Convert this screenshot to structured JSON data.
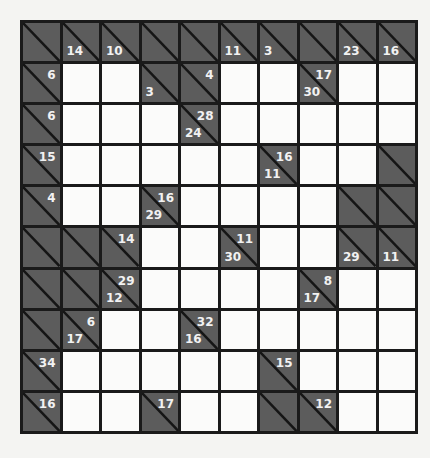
{
  "puzzle": {
    "type": "kakuro",
    "rows": 10,
    "cols": 10,
    "colors": {
      "block": "#5c5c5c",
      "white": "#fbfbfa",
      "grid_line": "#1a1a1a",
      "clue_text": "#f2f2f2"
    },
    "grid": [
      [
        {
          "t": "b"
        },
        {
          "t": "b",
          "down": "14"
        },
        {
          "t": "b",
          "down": "10"
        },
        {
          "t": "b"
        },
        {
          "t": "b"
        },
        {
          "t": "b",
          "down": "11"
        },
        {
          "t": "b",
          "down": "3"
        },
        {
          "t": "b"
        },
        {
          "t": "b",
          "down": "23"
        },
        {
          "t": "b",
          "down": "16"
        }
      ],
      [
        {
          "t": "b",
          "right": "6"
        },
        {
          "t": "w"
        },
        {
          "t": "w"
        },
        {
          "t": "b",
          "down": "3"
        },
        {
          "t": "b",
          "right": "4"
        },
        {
          "t": "w"
        },
        {
          "t": "w"
        },
        {
          "t": "b",
          "down": "30",
          "right": "17"
        },
        {
          "t": "w"
        },
        {
          "t": "w"
        }
      ],
      [
        {
          "t": "b",
          "right": "6"
        },
        {
          "t": "w"
        },
        {
          "t": "w"
        },
        {
          "t": "w"
        },
        {
          "t": "b",
          "down": "24",
          "right": "28"
        },
        {
          "t": "w"
        },
        {
          "t": "w"
        },
        {
          "t": "w"
        },
        {
          "t": "w"
        },
        {
          "t": "w"
        }
      ],
      [
        {
          "t": "b",
          "right": "15"
        },
        {
          "t": "w"
        },
        {
          "t": "w"
        },
        {
          "t": "w"
        },
        {
          "t": "w"
        },
        {
          "t": "w"
        },
        {
          "t": "b",
          "down": "11",
          "right": "16"
        },
        {
          "t": "w"
        },
        {
          "t": "w"
        },
        {
          "t": "b"
        }
      ],
      [
        {
          "t": "b",
          "right": "4"
        },
        {
          "t": "w"
        },
        {
          "t": "w"
        },
        {
          "t": "b",
          "down": "29",
          "right": "16"
        },
        {
          "t": "w"
        },
        {
          "t": "w"
        },
        {
          "t": "w"
        },
        {
          "t": "w"
        },
        {
          "t": "b"
        },
        {
          "t": "b"
        }
      ],
      [
        {
          "t": "b"
        },
        {
          "t": "b"
        },
        {
          "t": "b",
          "right": "14"
        },
        {
          "t": "w"
        },
        {
          "t": "w"
        },
        {
          "t": "b",
          "down": "30",
          "right": "11"
        },
        {
          "t": "w"
        },
        {
          "t": "w"
        },
        {
          "t": "b",
          "down": "29"
        },
        {
          "t": "b",
          "down": "11"
        }
      ],
      [
        {
          "t": "b"
        },
        {
          "t": "b"
        },
        {
          "t": "b",
          "down": "12",
          "right": "29"
        },
        {
          "t": "w"
        },
        {
          "t": "w"
        },
        {
          "t": "w"
        },
        {
          "t": "w"
        },
        {
          "t": "b",
          "down": "17",
          "right": "8"
        },
        {
          "t": "w"
        },
        {
          "t": "w"
        }
      ],
      [
        {
          "t": "b"
        },
        {
          "t": "b",
          "down": "17",
          "right": "6"
        },
        {
          "t": "w"
        },
        {
          "t": "w"
        },
        {
          "t": "b",
          "down": "16",
          "right": "32"
        },
        {
          "t": "w"
        },
        {
          "t": "w"
        },
        {
          "t": "w"
        },
        {
          "t": "w"
        },
        {
          "t": "w"
        }
      ],
      [
        {
          "t": "b",
          "right": "34"
        },
        {
          "t": "w"
        },
        {
          "t": "w"
        },
        {
          "t": "w"
        },
        {
          "t": "w"
        },
        {
          "t": "w"
        },
        {
          "t": "b",
          "right": "15"
        },
        {
          "t": "w"
        },
        {
          "t": "w"
        },
        {
          "t": "w"
        }
      ],
      [
        {
          "t": "b",
          "right": "16"
        },
        {
          "t": "w"
        },
        {
          "t": "w"
        },
        {
          "t": "b",
          "right": "17"
        },
        {
          "t": "w"
        },
        {
          "t": "w"
        },
        {
          "t": "b"
        },
        {
          "t": "b",
          "right": "12"
        },
        {
          "t": "w"
        },
        {
          "t": "w"
        }
      ]
    ]
  }
}
